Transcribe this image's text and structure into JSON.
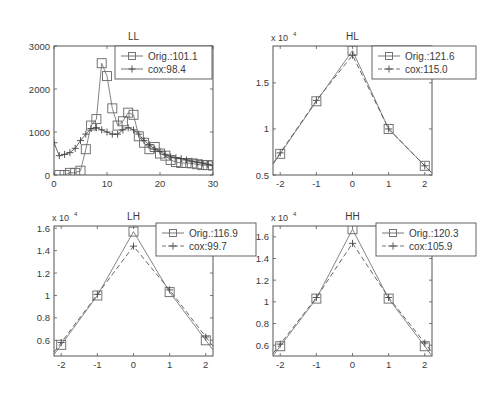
{
  "chart_data": [
    {
      "type": "line",
      "title": "LL",
      "xlabel": "",
      "ylabel": "",
      "xlim": [
        0,
        30
      ],
      "ylim": [
        0,
        3000
      ],
      "xticks": [
        "0",
        "10",
        "20",
        "30"
      ],
      "yticks": [
        "0",
        "1000",
        "2000",
        "3000"
      ],
      "y_multiplier": "",
      "grid": false,
      "legend_position": "upper right",
      "legend": [
        "Orig.:101.1",
        "cox:98.4"
      ],
      "x": [
        0,
        1,
        2,
        3,
        4,
        5,
        6,
        7,
        8,
        9,
        10,
        11,
        12,
        13,
        14,
        15,
        16,
        17,
        18,
        19,
        20,
        21,
        22,
        23,
        24,
        25,
        26,
        27,
        28,
        29,
        30
      ],
      "series": [
        {
          "name": "Orig.:101.1",
          "marker": "square",
          "style": "solid",
          "x": [
            1,
            2,
            3,
            4,
            5,
            6,
            7,
            8,
            9,
            10,
            11,
            12,
            13,
            14,
            15,
            16,
            17,
            18,
            19,
            20,
            21,
            22,
            23,
            24,
            25,
            26,
            27,
            28,
            29,
            30
          ],
          "values": [
            0,
            0,
            50,
            50,
            100,
            600,
            1150,
            1300,
            2600,
            2300,
            1550,
            1150,
            1250,
            1450,
            1400,
            900,
            750,
            600,
            650,
            500,
            450,
            350,
            300,
            280,
            280,
            270,
            250,
            230,
            230,
            220
          ]
        },
        {
          "name": "cox:98.4",
          "marker": "plus",
          "style": "solid",
          "x": [
            0,
            1,
            2,
            3,
            4,
            5,
            6,
            7,
            8,
            9,
            10,
            11,
            12,
            13,
            14,
            15,
            16,
            17,
            18,
            19,
            20,
            21,
            22,
            23,
            24,
            25,
            26,
            27,
            28,
            29,
            30
          ],
          "values": [
            750,
            450,
            480,
            520,
            620,
            800,
            950,
            1080,
            1100,
            1050,
            1000,
            950,
            950,
            1050,
            1100,
            1050,
            950,
            800,
            700,
            600,
            550,
            480,
            420,
            400,
            380,
            350,
            320,
            300,
            280,
            250,
            220
          ]
        }
      ]
    },
    {
      "type": "line",
      "title": "HL",
      "xlabel": "",
      "ylabel": "",
      "xlim": [
        -2.2,
        2.2
      ],
      "ylim": [
        0.5,
        1.9
      ],
      "xticks": [
        "-2",
        "-1",
        "0",
        "1",
        "2"
      ],
      "yticks": [
        "0.5",
        "1",
        "1.5"
      ],
      "y_multiplier": "x 10^4",
      "grid": false,
      "legend_position": "upper right",
      "legend": [
        "Orig.:121.6",
        "cox:115.0"
      ],
      "x": [
        -2,
        -1,
        0,
        1,
        2
      ],
      "series": [
        {
          "name": "Orig.:121.6",
          "marker": "square",
          "style": "solid",
          "values": [
            0.73,
            1.3,
            1.85,
            1.0,
            0.6
          ]
        },
        {
          "name": "cox:115.0",
          "marker": "plus",
          "style": "dashed",
          "values": [
            0.74,
            1.31,
            1.8,
            1.0,
            0.6
          ]
        }
      ]
    },
    {
      "type": "line",
      "title": "LH",
      "xlabel": "",
      "ylabel": "",
      "xlim": [
        -2.2,
        2.2
      ],
      "ylim": [
        0.46,
        1.62
      ],
      "xticks": [
        "-2",
        "-1",
        "0",
        "1",
        "2"
      ],
      "yticks": [
        "0.6",
        "0.8",
        "1",
        "1.2",
        "1.4",
        "1.6"
      ],
      "y_multiplier": "x 10^4",
      "grid": false,
      "legend_position": "upper right",
      "legend": [
        "Orig.:116.9",
        "cox:99.7"
      ],
      "x": [
        -2,
        -1,
        0,
        1,
        2
      ],
      "series": [
        {
          "name": "Orig.:116.9",
          "marker": "square",
          "style": "solid",
          "values": [
            0.56,
            1.0,
            1.57,
            1.03,
            0.6
          ]
        },
        {
          "name": "cox:99.7",
          "marker": "plus",
          "style": "dashed",
          "values": [
            0.58,
            1.01,
            1.44,
            1.05,
            0.63
          ]
        }
      ]
    },
    {
      "type": "line",
      "title": "HH",
      "xlabel": "",
      "ylabel": "",
      "xlim": [
        -2.2,
        2.2
      ],
      "ylim": [
        0.5,
        1.7
      ],
      "xticks": [
        "-2",
        "-1",
        "0",
        "1",
        "2"
      ],
      "yticks": [
        "0.6",
        "0.8",
        "1",
        "1.2",
        "1.4",
        "1.6"
      ],
      "y_multiplier": "x 10^4",
      "grid": false,
      "legend_position": "upper right",
      "legend": [
        "Orig.:120.3",
        "cox:105.9"
      ],
      "x": [
        -2,
        -1,
        0,
        1,
        2
      ],
      "series": [
        {
          "name": "Orig.:120.3",
          "marker": "square",
          "style": "solid",
          "values": [
            0.59,
            1.03,
            1.67,
            1.03,
            0.59
          ]
        },
        {
          "name": "cox:105.9",
          "marker": "plus",
          "style": "dashed",
          "values": [
            0.61,
            1.04,
            1.54,
            1.04,
            0.62
          ]
        }
      ]
    }
  ]
}
